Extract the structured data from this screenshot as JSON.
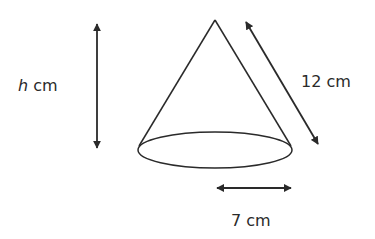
{
  "diagram": {
    "type": "cone",
    "labels": {
      "height_var": "h",
      "height_unit": " cm",
      "slant": "12 cm",
      "radius": "7 cm"
    },
    "values": {
      "slant_height_cm": 12,
      "radius_cm": 7,
      "height": "h"
    },
    "colors": {
      "stroke": "#2a2a2a",
      "background": "#ffffff"
    }
  }
}
